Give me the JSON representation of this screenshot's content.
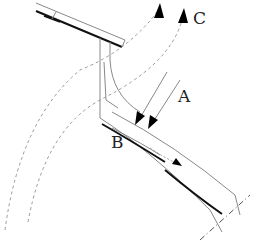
{
  "diagram": {
    "type": "technical line drawing",
    "labels": {
      "a": "A",
      "b": "B",
      "c": "C"
    },
    "colors": {
      "line_thin": "#888888",
      "line_thick": "#111111",
      "dashed": "#999999",
      "arrow": "#000000",
      "background": "#ffffff"
    }
  }
}
